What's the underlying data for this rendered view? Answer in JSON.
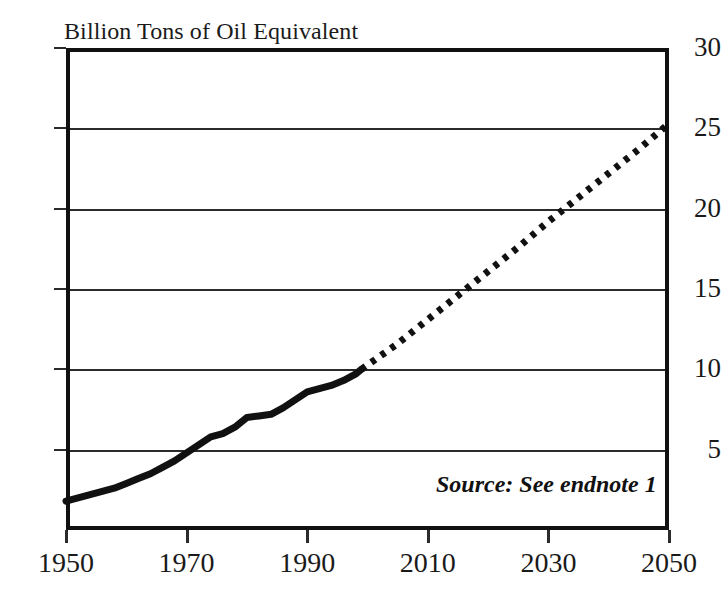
{
  "chart_data": {
    "type": "line",
    "title": "Billion Tons of Oil Equivalent",
    "xlabel": "",
    "ylabel": "Billion Tons of Oil Equivalent",
    "xlim": [
      1950,
      2050
    ],
    "ylim": [
      0,
      30
    ],
    "grid": true,
    "legend": "none",
    "y_ticks": [
      5,
      10,
      15,
      20,
      25,
      30
    ],
    "y_tick_labels": [
      "5",
      "10",
      "15",
      "20",
      "25",
      "30"
    ],
    "x_ticks": [
      1950,
      1970,
      1990,
      2010,
      2030,
      2050
    ],
    "x_tick_labels": [
      "1950",
      "1970",
      "1990",
      "2010",
      "2030",
      "2050"
    ],
    "annotations": [
      {
        "text": "Source: See endnote 1",
        "style": "bold-italic"
      }
    ],
    "series": [
      {
        "name": "Historical world energy use",
        "style": "solid",
        "color": "#111111",
        "x": [
          1950,
          1952,
          1954,
          1956,
          1958,
          1960,
          1962,
          1964,
          1966,
          1968,
          1970,
          1972,
          1974,
          1976,
          1978,
          1980,
          1982,
          1984,
          1986,
          1988,
          1990,
          1992,
          1994,
          1996,
          1998,
          1999
        ],
        "values": [
          1.8,
          2.0,
          2.2,
          2.4,
          2.6,
          2.9,
          3.2,
          3.5,
          3.9,
          4.3,
          4.8,
          5.3,
          5.8,
          6.0,
          6.4,
          7.0,
          7.1,
          7.2,
          7.6,
          8.1,
          8.6,
          8.8,
          9.0,
          9.3,
          9.7,
          10.0
        ]
      },
      {
        "name": "Projected world energy use",
        "style": "dotted",
        "color": "#111111",
        "x": [
          1999,
          2005,
          2010,
          2015,
          2020,
          2025,
          2030,
          2035,
          2040,
          2045,
          2050
        ],
        "values": [
          10.0,
          11.6,
          13.1,
          14.6,
          16.1,
          17.6,
          19.2,
          20.7,
          22.2,
          23.7,
          25.3
        ]
      }
    ]
  },
  "annotation": {
    "source_text": "Source: See endnote 1"
  }
}
